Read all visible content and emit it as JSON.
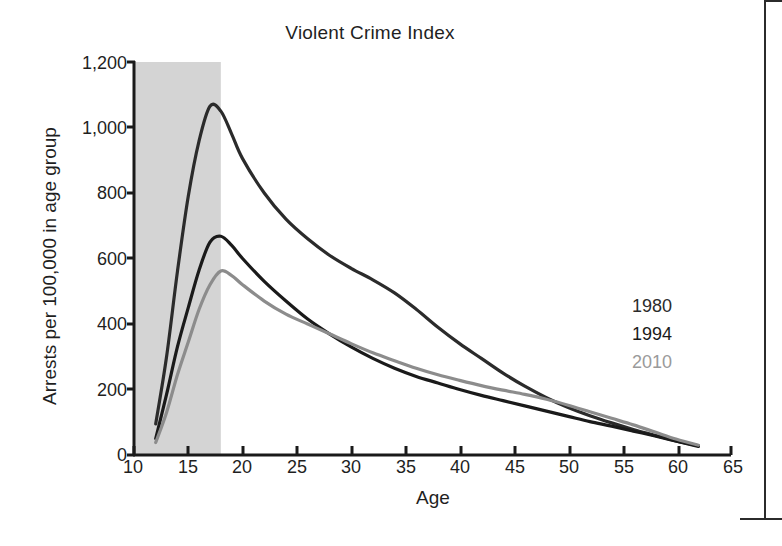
{
  "chart_data": {
    "type": "line",
    "title": "Violent Crime Index",
    "xlabel": "Age",
    "ylabel": "Arrests per 100,000 in age group",
    "xlim": [
      10,
      65
    ],
    "ylim": [
      0,
      1200
    ],
    "xticks": [
      "10",
      "15",
      "20",
      "25",
      "30",
      "35",
      "40",
      "45",
      "50",
      "55",
      "60",
      "65"
    ],
    "yticks": [
      "0",
      "200",
      "400",
      "600",
      "800",
      "1,000",
      "1,200"
    ],
    "grid": false,
    "legend_position": "right-inside",
    "shaded_band": {
      "label": "juvenile ages",
      "x_start": 10,
      "x_end": 18,
      "color": "#d4d4d4"
    },
    "x": [
      12,
      13,
      14,
      15,
      16,
      17,
      18,
      19,
      20,
      22,
      24,
      26,
      28,
      30,
      32,
      34,
      36,
      38,
      40,
      42,
      44,
      46,
      48,
      50,
      52,
      54,
      56,
      58,
      60,
      62
    ],
    "series": [
      {
        "name": "1980",
        "color": "#2b2b2b",
        "values": [
          95,
          300,
          560,
          790,
          960,
          1065,
          1050,
          980,
          905,
          800,
          720,
          660,
          610,
          570,
          535,
          495,
          445,
          390,
          340,
          295,
          250,
          210,
          175,
          145,
          120,
          98,
          78,
          60,
          42,
          28
        ]
      },
      {
        "name": "1994",
        "color": "#1a1a1a",
        "values": [
          50,
          185,
          330,
          450,
          565,
          650,
          668,
          640,
          600,
          530,
          470,
          415,
          370,
          330,
          295,
          265,
          240,
          220,
          200,
          182,
          166,
          150,
          134,
          118,
          102,
          88,
          73,
          58,
          42,
          26
        ]
      },
      {
        "name": "2010",
        "color": "#8c8c8c",
        "values": [
          38,
          130,
          245,
          345,
          445,
          520,
          562,
          548,
          520,
          470,
          430,
          400,
          370,
          340,
          312,
          288,
          265,
          245,
          228,
          212,
          198,
          185,
          170,
          152,
          132,
          112,
          92,
          70,
          48,
          30
        ]
      }
    ]
  },
  "chart": {
    "title": "Violent Crime Index",
    "x_axis_title": "Age",
    "y_axis_title": "Arrests per 100,000 in age group",
    "y_labels": [
      "1,200",
      "1,000",
      "800",
      "600",
      "400",
      "200",
      "0"
    ],
    "x_labels": [
      "10",
      "15",
      "20",
      "25",
      "30",
      "35",
      "40",
      "45",
      "50",
      "55",
      "60",
      "65"
    ]
  },
  "legend": {
    "items": [
      {
        "label": "1980",
        "color": "#2b2b2b"
      },
      {
        "label": "1994",
        "color": "#1a1a1a"
      },
      {
        "label": "2010",
        "color": "#9a9a9a"
      }
    ]
  }
}
